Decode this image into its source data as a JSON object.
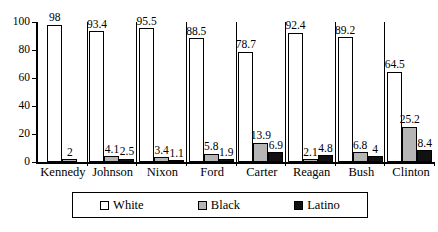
{
  "chart_data": {
    "type": "bar",
    "title": "",
    "subtitle": "",
    "xlabel": "",
    "ylabel": "",
    "ylim": [
      0,
      100
    ],
    "yticks": [
      0,
      20,
      40,
      60,
      80,
      100
    ],
    "ytick_labels": [
      "0",
      "20",
      "40",
      "60",
      "80",
      "100"
    ],
    "grid": false,
    "legend_position": "bottom",
    "categories": [
      "Kennedy",
      "Johnson",
      "Nixon",
      "Ford",
      "Carter",
      "Reagan",
      "Bush",
      "Clinton"
    ],
    "series": [
      {
        "name": "White",
        "color": "#ffffff",
        "values": [
          98,
          93.4,
          95.5,
          88.5,
          78.7,
          92.4,
          89.2,
          64.5
        ],
        "labels": [
          "98",
          "93.4",
          "95.5",
          "88.5",
          "78.7",
          "92.4",
          "89.2",
          "64.5"
        ]
      },
      {
        "name": "Black",
        "color": "#b5b5b5",
        "values": [
          2,
          4.1,
          3.4,
          5.8,
          13.9,
          2.1,
          6.8,
          25.2
        ],
        "labels": [
          "2",
          "4.1",
          "3.4",
          "5.8",
          "13.9",
          "2.1",
          "6.8",
          "25.2"
        ]
      },
      {
        "name": "Latino",
        "color": "#111111",
        "values": [
          null,
          2.5,
          1.1,
          1.9,
          6.9,
          4.8,
          4,
          8.4
        ],
        "labels": [
          "",
          "2.5",
          "1.1",
          "1.9",
          "6.9",
          "4.8",
          "4",
          "8.4"
        ]
      }
    ]
  },
  "legend": {
    "items": [
      {
        "label": "White",
        "swatch": "white-swatch"
      },
      {
        "label": "Black",
        "swatch": "gray-swatch"
      },
      {
        "label": "Latino",
        "swatch": "black-swatch"
      }
    ]
  },
  "axis": {
    "y_labels": [
      "100",
      "80",
      "60",
      "40",
      "20",
      "0"
    ]
  },
  "top_crop_artifact": "··"
}
